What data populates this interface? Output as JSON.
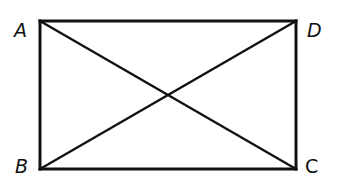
{
  "diagram": {
    "type": "rectangle-with-diagonals",
    "stroke_color": "#111111",
    "background": "#ffffff",
    "vertices": {
      "A": {
        "label": "A",
        "x": 40,
        "y": 21
      },
      "D": {
        "label": "D",
        "x": 296,
        "y": 21
      },
      "B": {
        "label": "B",
        "x": 40,
        "y": 169
      },
      "C": {
        "label": "C",
        "x": 296,
        "y": 169
      }
    },
    "sides": [
      "AD",
      "DC",
      "CB",
      "BA"
    ],
    "diagonals": [
      "AC",
      "BD"
    ]
  }
}
